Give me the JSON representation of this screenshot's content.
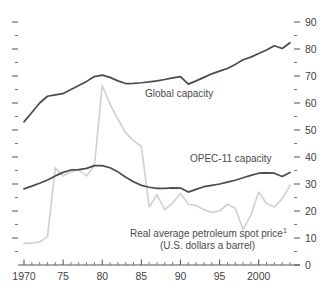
{
  "annotations": {
    "global_capacity": "Global capacity",
    "opec_capacity": "OPEC-11 capacity",
    "spot_price_line1": "Real average petroleum spot price",
    "spot_price_footnote": "1",
    "spot_price_line2": "(U.S. dollars a barrel)"
  },
  "axis": {
    "y_tick_labels": [
      "90",
      "80",
      "70",
      "60",
      "50",
      "40",
      "30",
      "20",
      "10",
      "0"
    ],
    "x_tick_labels": [
      "1970",
      "75",
      "80",
      "85",
      "90",
      "95",
      "2000"
    ]
  },
  "colors": {
    "dark_series": "#4b4b4e",
    "light_series": "#d2d2d2",
    "axis": "#55555a",
    "text": "#3f3f3f",
    "background": "#ffffff"
  },
  "chart_data": {
    "type": "line",
    "title": "",
    "xlabel": "",
    "ylabel": "",
    "xlim": [
      1970,
      2004
    ],
    "ylim": [
      0,
      90
    ],
    "grid": false,
    "legend": "inline-annotations",
    "y_major_step": 10,
    "y_minor_step": 5,
    "x_major_step": 5,
    "x_minor_step": 1,
    "x": [
      1970,
      1971,
      1972,
      1973,
      1974,
      1975,
      1976,
      1977,
      1978,
      1979,
      1980,
      1981,
      1982,
      1983,
      1984,
      1985,
      1986,
      1987,
      1988,
      1989,
      1990,
      1991,
      1992,
      1993,
      1994,
      1995,
      1996,
      1997,
      1998,
      1999,
      2000,
      2001,
      2002,
      2003,
      2004
    ],
    "series": [
      {
        "name": "Global capacity",
        "color": "#4b4b4e",
        "units": "millions of barrels a day",
        "values": [
          53.0,
          56.5,
          60.0,
          62.5,
          63.0,
          63.5,
          65.0,
          66.5,
          68.0,
          69.8,
          70.3,
          69.5,
          68.2,
          67.2,
          67.3,
          67.5,
          67.8,
          68.2,
          68.7,
          69.3,
          69.8,
          67.0,
          68.2,
          69.5,
          70.8,
          71.8,
          72.8,
          74.3,
          76.0,
          77.0,
          78.3,
          79.6,
          81.2,
          80.2,
          82.3
        ]
      },
      {
        "name": "OPEC-11 capacity",
        "color": "#4b4b4e",
        "units": "millions of barrels a day",
        "values": [
          28.2,
          29.2,
          30.3,
          31.5,
          33.0,
          34.3,
          35.2,
          35.3,
          35.8,
          36.8,
          36.8,
          36.0,
          34.5,
          32.5,
          30.8,
          29.5,
          28.8,
          28.4,
          28.4,
          28.6,
          28.5,
          27.0,
          28.0,
          29.0,
          29.5,
          30.0,
          30.7,
          31.4,
          32.3,
          33.2,
          34.0,
          34.1,
          34.0,
          32.8,
          34.3
        ]
      },
      {
        "name": "Real average petroleum spot price",
        "color": "#d2d2d2",
        "units": "U.S. dollars a barrel",
        "values": [
          8.0,
          8.2,
          8.5,
          10.5,
          36.0,
          33.0,
          34.5,
          35.3,
          33.0,
          36.8,
          66.5,
          59.5,
          54.0,
          49.0,
          46.0,
          44.0,
          21.5,
          26.0,
          20.5,
          23.0,
          26.5,
          22.5,
          22.0,
          20.5,
          19.5,
          20.0,
          22.5,
          21.0,
          13.2,
          18.5,
          27.0,
          22.8,
          21.5,
          24.5,
          29.5
        ]
      }
    ]
  }
}
